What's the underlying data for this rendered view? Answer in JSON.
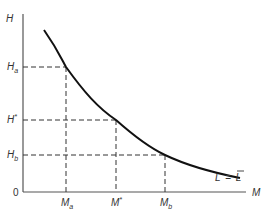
{
  "diagram": {
    "type": "indifference-curve",
    "axes": {
      "y_label": "H",
      "x_label": "M",
      "origin_label": "0"
    },
    "curve_label": {
      "lhs": "L",
      "eq": "=",
      "rhs": "L"
    },
    "y_ticks": [
      {
        "main": "H",
        "mod": "a",
        "kind": "sub"
      },
      {
        "main": "H",
        "mod": "*",
        "kind": "sup"
      },
      {
        "main": "H",
        "mod": "b",
        "kind": "sub"
      }
    ],
    "x_ticks": [
      {
        "main": "M",
        "mod": "a",
        "kind": "sub"
      },
      {
        "main": "M",
        "mod": "*",
        "kind": "sup"
      },
      {
        "main": "M",
        "mod": "b",
        "kind": "sub"
      }
    ],
    "points": [
      {
        "name": "a",
        "x": 66,
        "y": 67
      },
      {
        "name": "star",
        "x": 116,
        "y": 120
      },
      {
        "name": "b",
        "x": 165,
        "y": 155
      }
    ],
    "colors": {
      "axis": "#555555",
      "curve": "#111111",
      "dash": "#333333"
    }
  }
}
